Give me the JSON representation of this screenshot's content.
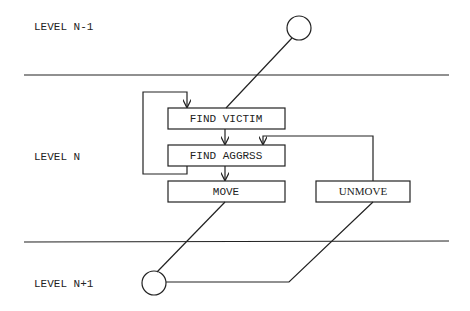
{
  "levels": {
    "upper": "LEVEL N-1",
    "middle": "LEVEL N",
    "lower": "LEVEL N+1"
  },
  "boxes": {
    "find_victim": "FIND VICTIM",
    "find_aggressor": "FIND AGGRSS",
    "move": "MOVE",
    "unmove": "UNMOVE"
  },
  "colors": {
    "stroke": "#222222",
    "background": "#ffffff"
  }
}
